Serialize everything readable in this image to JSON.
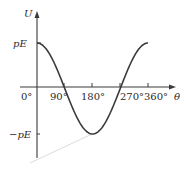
{
  "chart_data": {
    "type": "line",
    "title": "",
    "xlabel": "θ",
    "ylabel": "U",
    "x_ticks": [
      "0°",
      "90°",
      "180°",
      "270°",
      "360°"
    ],
    "y_ticks": [
      "pE",
      "−pE"
    ],
    "x": [
      0,
      45,
      90,
      135,
      180,
      225,
      270,
      315,
      360
    ],
    "series": [
      {
        "name": "U = −pE cos θ shown as pE·cos θ",
        "formula": "U = pE cos θ",
        "values_in_pE": [
          1,
          0.707,
          0,
          -0.707,
          -1,
          -0.707,
          0,
          0.707,
          1
        ]
      }
    ],
    "xlim": [
      0,
      360
    ],
    "ylim": [
      -1,
      1
    ],
    "grid": false,
    "legend": null
  },
  "axes": {
    "y_label": "U",
    "x_label": "θ",
    "y_tick_top": "pE",
    "y_tick_bottom": "−pE",
    "x_tick_0": "0°",
    "x_tick_90": "90°",
    "x_tick_180": "180°",
    "x_tick_270": "270°",
    "x_tick_360": "360°"
  },
  "colors": {
    "curve": "#3a3a3a",
    "axis": "#3a3a3a",
    "artifact": "#d8d8d8"
  }
}
